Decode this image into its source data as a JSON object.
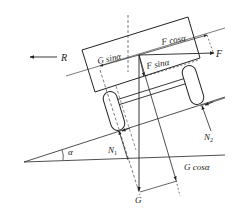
{
  "diagram": {
    "labels": {
      "R": "R",
      "F": "F",
      "F_cos": "F cosα",
      "F_sin": "F sinα",
      "G_sin": "G sinα",
      "G_cos": "G cosα",
      "G": "G",
      "N1": "N",
      "N1_sub": "1",
      "N2": "N",
      "N2_sub": "2",
      "alpha": "α"
    },
    "colors": {
      "stroke": "#222222",
      "background": "#ffffff"
    }
  }
}
